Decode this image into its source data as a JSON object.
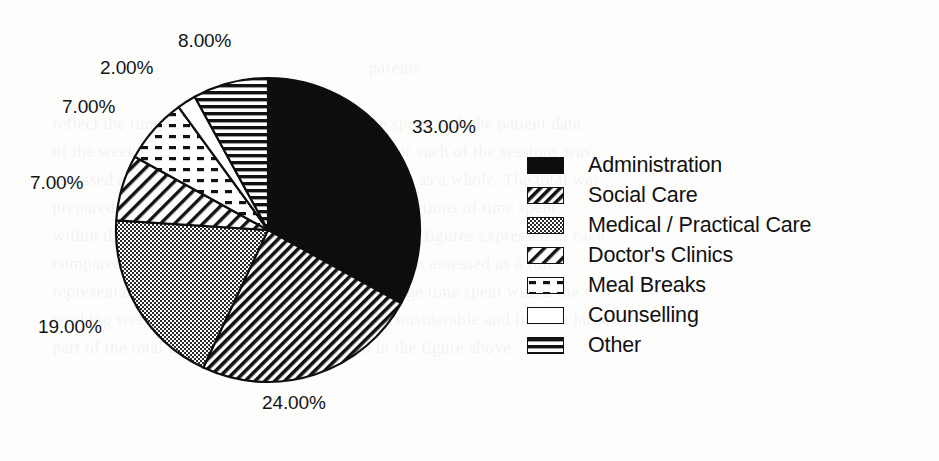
{
  "figure": {
    "background_color": "#fdfdfc",
    "ink_color": "#111111"
  },
  "ghost_text": {
    "note": "faint bleed-through text from reverse side of scanned page",
    "lines": [
      "",
      "                                                                        parents",
      "",
      "    reflect the time spent on the ward and the time spent with the patient data",
      "    of the week and the number of hours available for each of the sessions was",
      "    assessed against the recorded workload of the unit as a whole. The total was",
      "    prepared from the individual returns and the proportions of time spent",
      "    within the overall period of the working week. The figures expressed in each",
      "    compared with the previous year's results were then assessed as a full",
      "    representation of the work undertaken. The average time spent within the",
      "    working week on administration tasks is not inconsiderable and forms a large",
      "    part of the total time available, as illustrated in the figure above."
    ]
  },
  "chart_data": {
    "type": "pie",
    "title": "",
    "start_angle_deg": 0,
    "direction": "clockwise",
    "center": {
      "x": 268,
      "y": 230
    },
    "radius": 152,
    "categories": [
      "Administration",
      "Social Care",
      "Medical / Practical Care",
      "Doctor's Clinics",
      "Meal Breaks",
      "Counselling",
      "Other"
    ],
    "values": [
      33,
      24,
      19,
      7,
      7,
      2,
      8
    ],
    "value_labels": [
      "33.00%",
      "24.00%",
      "19.00%",
      "7.00%",
      "7.00%",
      "2.00%",
      "8.00%"
    ],
    "units": "percent",
    "total": 100,
    "patterns": [
      "solid-black",
      "diagonal-hatch-dense",
      "dotted-gray-fill",
      "diagonal-hatch-wide",
      "dashed-dot",
      "white-empty",
      "horizontal-lines"
    ],
    "legend_position": "right",
    "grid": false
  },
  "labels": [
    {
      "id": "label-administration",
      "text": "33.00%",
      "left": 412,
      "top": 116
    },
    {
      "id": "label-social-care",
      "text": "24.00%",
      "left": 262,
      "top": 392
    },
    {
      "id": "label-medical-practical-care",
      "text": "19.00%",
      "left": 38,
      "top": 316
    },
    {
      "id": "label-doctors-clinics",
      "text": "7.00%",
      "left": 30,
      "top": 172
    },
    {
      "id": "label-meal-breaks",
      "text": "7.00%",
      "left": 62,
      "top": 96
    },
    {
      "id": "label-counselling",
      "text": "2.00%",
      "left": 100,
      "top": 57
    },
    {
      "id": "label-other",
      "text": "8.00%",
      "left": 178,
      "top": 30
    }
  ],
  "legend": {
    "items": [
      {
        "label": "Administration",
        "pattern": "solid-black",
        "swatch_name": "legend-swatch-administration"
      },
      {
        "label": "Social Care",
        "pattern": "diagonal-hatch-dense",
        "swatch_name": "legend-swatch-social-care"
      },
      {
        "label": "Medical / Practical Care",
        "pattern": "dotted-gray-fill",
        "swatch_name": "legend-swatch-medical-practical-care"
      },
      {
        "label": "Doctor's Clinics",
        "pattern": "diagonal-hatch-wide",
        "swatch_name": "legend-swatch-doctors-clinics"
      },
      {
        "label": "Meal Breaks",
        "pattern": "dashed-dot",
        "swatch_name": "legend-swatch-meal-breaks"
      },
      {
        "label": "Counselling",
        "pattern": "white-empty",
        "swatch_name": "legend-swatch-counselling"
      },
      {
        "label": "Other",
        "pattern": "horizontal-lines",
        "swatch_name": "legend-swatch-other"
      }
    ]
  }
}
